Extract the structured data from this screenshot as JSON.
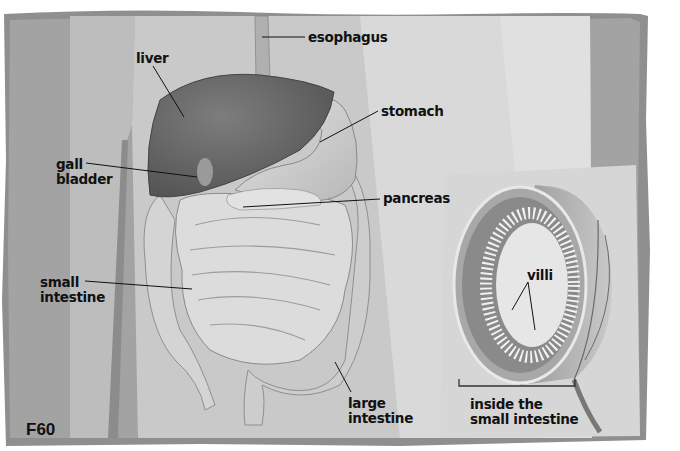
{
  "figure": {
    "id": "F60",
    "colors": {
      "frame": "#8f8f8f",
      "body_background": "#a6a6a6",
      "torso_light": "#cfcfcf",
      "panel_light": "#dcdcdc",
      "liver": "#6e6e6e",
      "organ_light": "#d8d8d8",
      "label_text": "#111111"
    }
  },
  "labels": {
    "esophagus": "esophagus",
    "liver": "liver",
    "stomach": "stomach",
    "gall_bladder": "gall\nbladder",
    "pancreas": "pancreas",
    "small_intestine": "small\nintestine",
    "large_intestine": "large\nintestine",
    "villi": "villi",
    "inset_caption": "inside the\nsmall intestine"
  }
}
